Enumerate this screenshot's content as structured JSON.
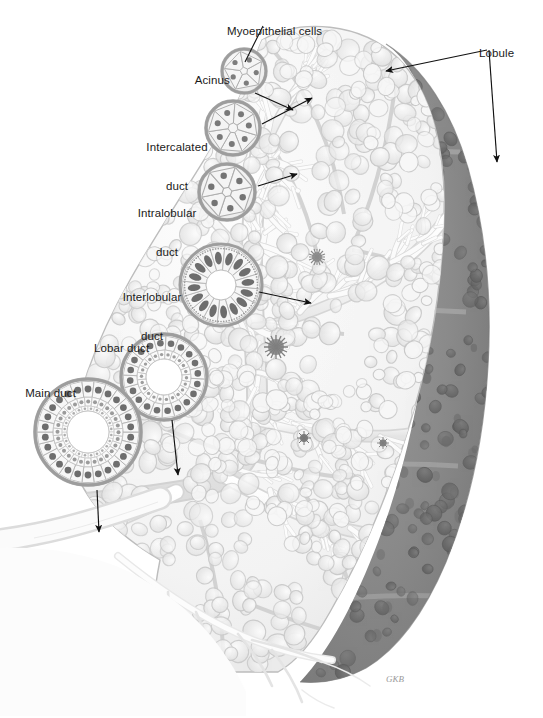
{
  "figure": {
    "signature": "GKB",
    "background_color": "#ffffff",
    "ink_color": "#1a1a1a",
    "tissue_light_color": "#f4f4f4",
    "tissue_outline_color": "#b9b9b9",
    "lobule_dark_color": "#8d8d8d",
    "lobule_dark_edge_color": "#6f6f6f",
    "nucleus_color": "#6b6b6b",
    "duct_lumen_color": "#ffffff"
  },
  "labels": [
    {
      "id": "myoepithelial-cells",
      "text": "Myoepithelial cells",
      "x": 268,
      "y": 12,
      "align": "center",
      "lines": [
        "Myoepithelial cells"
      ]
    },
    {
      "id": "acinus",
      "text": "Acinus",
      "x": 206,
      "y": 61,
      "align": "center",
      "lines": [
        "Acinus"
      ]
    },
    {
      "id": "intercalated-duct",
      "text": "Intercalated duct",
      "x": 177,
      "y": 115,
      "align": "center",
      "lines": [
        "Intercalated",
        "duct"
      ]
    },
    {
      "id": "intralobular-duct",
      "text": "Intralobular duct",
      "x": 167,
      "y": 181,
      "align": "center",
      "lines": [
        "Intralobular",
        "duct"
      ]
    },
    {
      "id": "interlobular-duct",
      "text": "Interlobular duct",
      "x": 152,
      "y": 265,
      "align": "center",
      "lines": [
        "Interlobular",
        "duct"
      ]
    },
    {
      "id": "lobar-duct",
      "text": "Lobar duct",
      "x": 115,
      "y": 329,
      "align": "center",
      "lines": [
        "Lobar duct"
      ]
    },
    {
      "id": "main-duct",
      "text": "Main duct",
      "x": 41,
      "y": 374,
      "align": "left",
      "lines": [
        "Main duct"
      ]
    },
    {
      "id": "lobule",
      "text": "Lobule",
      "x": 490,
      "y": 34,
      "align": "center",
      "lines": [
        "Lobule"
      ]
    }
  ],
  "insets": [
    {
      "id": "acinus-inset",
      "name": "acinus-cross-section",
      "cx": 244,
      "cy": 71,
      "r": 22,
      "cells": 5,
      "type": "acinus"
    },
    {
      "id": "intercalated-duct-inset",
      "name": "intercalated-duct-cross-section",
      "cx": 233,
      "cy": 128,
      "r": 27,
      "cells": 7,
      "type": "duct-small"
    },
    {
      "id": "intralobular-duct-inset",
      "name": "intralobular-duct-cross-section",
      "cx": 227,
      "cy": 192,
      "r": 28,
      "cells": 6,
      "type": "duct-small"
    },
    {
      "id": "interlobular-duct-inset",
      "name": "interlobular-duct-cross-section",
      "cx": 221,
      "cy": 285,
      "r": 41,
      "cells": 16,
      "type": "duct-columnar"
    },
    {
      "id": "lobar-duct-inset",
      "name": "lobar-duct-cross-section",
      "cx": 164,
      "cy": 377,
      "r": 43,
      "cells": 20,
      "type": "duct-columnar-2"
    },
    {
      "id": "main-duct-inset",
      "name": "main-duct-cross-section",
      "cx": 88,
      "cy": 432,
      "r": 53,
      "cells": 26,
      "type": "duct-stratified"
    }
  ],
  "leaders": [
    {
      "id": "myoepithelial-leader",
      "from": [
        263,
        26
      ],
      "to": [
        245,
        62
      ],
      "arrow": false
    },
    {
      "id": "acinus-leader",
      "from": [
        255,
        93
      ],
      "to": [
        293,
        110
      ],
      "arrow": true
    },
    {
      "id": "intercalated-leader",
      "from": [
        262,
        124
      ],
      "to": [
        312,
        98
      ],
      "arrow": true
    },
    {
      "id": "intralobular-leader",
      "from": [
        258,
        186
      ],
      "to": [
        297,
        174
      ],
      "arrow": true
    },
    {
      "id": "interlobular-leader",
      "from": [
        259,
        292
      ],
      "to": [
        311,
        303
      ],
      "arrow": true
    },
    {
      "id": "lobar-leader",
      "from": [
        172,
        420
      ],
      "to": [
        178,
        475
      ],
      "arrow": true
    },
    {
      "id": "main-duct-leader",
      "from": [
        97,
        490
      ],
      "to": [
        99,
        532
      ],
      "arrow": true
    },
    {
      "id": "lobule-leader-upper",
      "from": [
        487,
        50
      ],
      "to": [
        386,
        71
      ],
      "arrow": true
    },
    {
      "id": "lobule-leader-lower",
      "from": [
        489,
        50
      ],
      "to": [
        497,
        162
      ],
      "arrow": true
    }
  ],
  "gland": {
    "description": "Sagittal section through a compound tubuloacinar salivary gland showing branching duct tree and serous acini",
    "pale_region": "anterior cut face with branching intralobular ducts and acini",
    "dark_region": "intact posterior lobules seen through capsule"
  }
}
